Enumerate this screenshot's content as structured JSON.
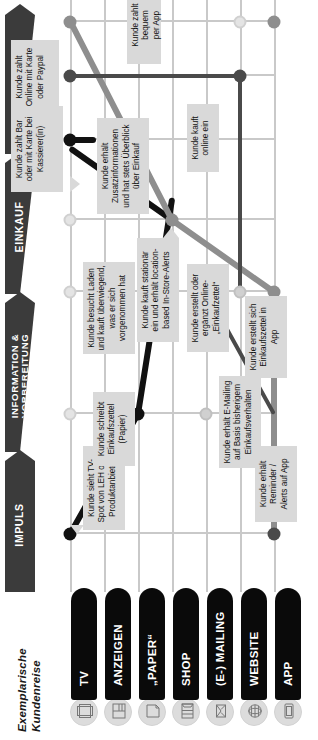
{
  "title": "Exemplarische Kundenreise",
  "phases": [
    {
      "label": "IMPULS",
      "lines": [
        "IMPULS"
      ]
    },
    {
      "label": "INFORMATION & VORBEREITUNG",
      "lines": [
        "INFORMATION &",
        "VORBEREITUNG"
      ]
    },
    {
      "label": "EINKAUF",
      "lines": [
        "EINKAUF"
      ]
    },
    {
      "label": "BEZAHLUNG",
      "lines": [
        "BEZAHLUNG"
      ]
    }
  ],
  "channels": [
    {
      "label": "TV",
      "icon": "tv-icon"
    },
    {
      "label": "ANZEIGEN",
      "icon": "newspaper-ad-icon"
    },
    {
      "label": "„PAPER“",
      "icon": "paper-sheet-icon"
    },
    {
      "label": "SHOP",
      "icon": "store-icon"
    },
    {
      "label": "(E-) MAILING",
      "icon": "envelope-icon"
    },
    {
      "label": "WEBSITE",
      "icon": "globe-icon"
    },
    {
      "label": "APP",
      "icon": "smartphone-icon"
    }
  ],
  "callouts": [
    {
      "id": "tv-spot",
      "lines": [
        "Kunde sieht TV-",
        "Spot von LEH oder",
        "Produktanbieter"
      ]
    },
    {
      "id": "paper-list",
      "lines": [
        "Kunde schreibt",
        "Einkaufszettel",
        "(Papier)"
      ]
    },
    {
      "id": "store-visit",
      "lines": [
        "Kunde besucht Laden",
        "und kauft überwiegend,",
        "was er sich",
        "vorgenommen hat"
      ]
    },
    {
      "id": "cash-payment",
      "lines": [
        "Kunde zahlt Bar",
        "oder mit Karte bei",
        "Kassierer(in)"
      ]
    },
    {
      "id": "email-mailing",
      "lines": [
        "Kunde erhält E-Mailing",
        "auf Basis bisherigem",
        "Einkaufsverhalten"
      ]
    },
    {
      "id": "online-list",
      "lines": [
        "Kunde erstellt oder",
        "ergänzt Online-",
        "„Einkaufzettel“"
      ]
    },
    {
      "id": "online-buy",
      "lines": [
        "Kunde kauft",
        "online ein"
      ]
    },
    {
      "id": "online-payment",
      "lines": [
        "Kunde zahlt",
        "Online mit Karte",
        "oder Paypal"
      ]
    },
    {
      "id": "app-reminder",
      "lines": [
        "Kunde erhält",
        "Reminder /",
        "Alerts auf App"
      ]
    },
    {
      "id": "app-list",
      "lines": [
        "Kunde erstellt sich",
        "Einkaufszettel in",
        "App"
      ]
    },
    {
      "id": "instore-alerts",
      "lines": [
        "Kunde kauft stationär",
        "ein und erhält location-",
        "based In-Store-Alerts"
      ]
    },
    {
      "id": "extra-info",
      "lines": [
        "Kunde erhält",
        "Zusatzinformationen",
        "und hat stets Überblick",
        "über Einkauf"
      ]
    },
    {
      "id": "app-payment",
      "lines": [
        "Kunde zahlt bequem",
        "per App"
      ]
    }
  ],
  "colors": {
    "phase_bar": "#3b3b3b",
    "channel_pill": "#0a0a0a",
    "grid": "#c9c9c9",
    "callout_bg": "#d9d9d9",
    "journey_black": "#111111",
    "journey_dark_gray": "#4a4a4a",
    "journey_gray": "#8e8e8e",
    "journey_light": "#d0d0d0"
  }
}
